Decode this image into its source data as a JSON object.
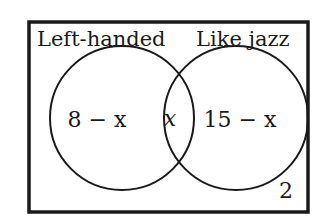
{
  "diagram": {
    "type": "venn",
    "universe_label": "",
    "sets": [
      {
        "name": "Left-handed",
        "only_region": "8 − x"
      },
      {
        "name": "Like jazz",
        "only_region": "15 − x"
      }
    ],
    "intersection": "x",
    "outside": "2",
    "colors": {
      "stroke": "#1a1a1a",
      "background": "#ffffff"
    }
  }
}
